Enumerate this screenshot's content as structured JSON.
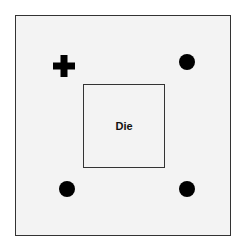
{
  "diagram": {
    "die_label": "Die",
    "markers": [
      {
        "type": "cross",
        "position": "top-left"
      },
      {
        "type": "dot",
        "position": "top-right"
      },
      {
        "type": "dot",
        "position": "bottom-left"
      },
      {
        "type": "dot",
        "position": "bottom-right"
      }
    ],
    "colors": {
      "marker": "#000000",
      "background": "#f3f3f3",
      "border": "#333333"
    }
  }
}
